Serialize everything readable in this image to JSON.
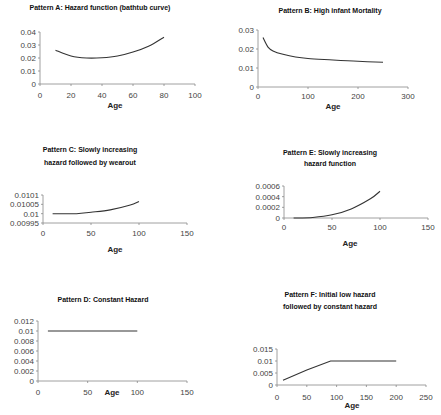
{
  "chart_data": [
    {
      "id": "A",
      "type": "line",
      "title": "Pattern A: Hazard function (bathtub curve)",
      "xlabel": "Age",
      "ylabel": "",
      "xlim": [
        0,
        100
      ],
      "ylim": [
        0,
        0.04
      ],
      "xticks": [
        "0",
        "20",
        "40",
        "60",
        "80",
        "100"
      ],
      "yticks": [
        "0",
        "0.01",
        "0.02",
        "0.03",
        "0.04"
      ],
      "x": [
        10,
        20,
        30,
        40,
        50,
        60,
        70,
        80
      ],
      "values": [
        0.026,
        0.0215,
        0.02,
        0.0202,
        0.0215,
        0.0245,
        0.029,
        0.036
      ],
      "grid": false,
      "legend": "none"
    },
    {
      "id": "B",
      "type": "line",
      "title": "Pattern B: High infant Mortality",
      "xlabel": "Age",
      "ylabel": "",
      "xlim": [
        0,
        300
      ],
      "ylim": [
        0,
        0.03
      ],
      "xticks": [
        "0",
        "100",
        "200",
        "300"
      ],
      "yticks": [
        "0",
        "0.01",
        "0.02",
        "0.03"
      ],
      "x": [
        10,
        20,
        30,
        50,
        75,
        100,
        150,
        200,
        250
      ],
      "values": [
        0.026,
        0.021,
        0.019,
        0.0172,
        0.0158,
        0.015,
        0.0142,
        0.0135,
        0.013
      ],
      "grid": false,
      "legend": "none"
    },
    {
      "id": "C",
      "type": "line",
      "title": "Pattern C: Slowly increasing hazard followed by wearout",
      "xlabel": "Age",
      "ylabel": "",
      "xlim": [
        0,
        150
      ],
      "ylim": [
        0.00995,
        0.0101
      ],
      "xticks": [
        "0",
        "50",
        "100",
        "150"
      ],
      "yticks": [
        "0.00995",
        "0.01",
        "0.01005",
        "0.0101"
      ],
      "x": [
        10,
        35,
        50,
        70,
        90,
        100
      ],
      "values": [
        0.01,
        0.01,
        0.010008,
        0.01002,
        0.010045,
        0.010065
      ],
      "grid": false,
      "legend": "none"
    },
    {
      "id": "E",
      "type": "line",
      "title": "Pattern E: Slowly increasing hazard function",
      "xlabel": "Age",
      "ylabel": "",
      "xlim": [
        0,
        150
      ],
      "ylim": [
        0,
        0.0006
      ],
      "xticks": [
        "0",
        "50",
        "100",
        "150"
      ],
      "yticks": [
        "0",
        "0.0002",
        "0.0004",
        "0.0006"
      ],
      "x": [
        10,
        30,
        50,
        70,
        90,
        100
      ],
      "values": [
        0.0,
        1e-05,
        6e-05,
        0.00017,
        0.00036,
        0.0005
      ],
      "grid": false,
      "legend": "none"
    },
    {
      "id": "D",
      "type": "line",
      "title": "Pattern D: Constant Hazard",
      "xlabel": "Age",
      "ylabel": "",
      "xlim": [
        0,
        150
      ],
      "ylim": [
        0,
        0.012
      ],
      "xticks": [
        "0",
        "50",
        "100",
        "150"
      ],
      "yticks": [
        "0",
        "0.002",
        "0.004",
        "0.006",
        "0.008",
        "0.01",
        "0.012"
      ],
      "x": [
        10,
        100
      ],
      "values": [
        0.01,
        0.01
      ],
      "grid": false,
      "legend": "none"
    },
    {
      "id": "F",
      "type": "line",
      "title": "Pattern F: Initial low hazard followed by constant hazard",
      "xlabel": "Age",
      "ylabel": "",
      "xlim": [
        0,
        250
      ],
      "ylim": [
        0,
        0.015
      ],
      "xticks": [
        "0",
        "50",
        "100",
        "150",
        "200",
        "250"
      ],
      "yticks": [
        "0",
        "0.005",
        "0.01",
        "0.015"
      ],
      "x": [
        10,
        50,
        90,
        200
      ],
      "values": [
        0.002,
        0.0062,
        0.01,
        0.01
      ],
      "grid": false,
      "legend": "none"
    }
  ],
  "layout": {
    "A": {
      "title_lines": [
        "Pattern A: Hazard function (bathtub curve)"
      ],
      "title_x": 100,
      "title_y": 10,
      "ax": 40,
      "ay0": 84,
      "aytop": 32,
      "axr": 195,
      "xlabel_y": 108
    },
    "B": {
      "title_lines": [
        "Pattern B: High infant Mortality"
      ],
      "title_x": 330,
      "title_y": 13,
      "ax": 258,
      "ay0": 87,
      "aytop": 30,
      "axr": 408,
      "xlabel_y": 109
    }
  },
  "caption": "Figure: Six failure patterns of hazard function"
}
